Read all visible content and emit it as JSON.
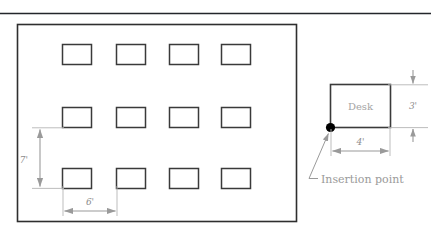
{
  "figure": {
    "title_rule": "top-horizontal-rule",
    "colors": {
      "outline": "#2e2e2e",
      "desk_stroke": "#3a3a3a",
      "dimension": "#9a9a9a",
      "text": "#8c8c8c",
      "label": "#9a9a9a",
      "insertion_dot": "#000000",
      "background": "#ffffff"
    }
  },
  "room_plan": {
    "name": "office-floor-plan",
    "rows": 3,
    "columns": 4,
    "desk_count": 12,
    "dimensions": [
      {
        "id": "vertical-row-spacing",
        "label": "7'",
        "value": 7,
        "unit": "ft",
        "orientation": "vertical",
        "describes": "row-to-row spacing"
      },
      {
        "id": "horizontal-column-spacing",
        "label": "6'",
        "value": 6,
        "unit": "ft",
        "orientation": "horizontal",
        "describes": "column-to-column spacing"
      }
    ]
  },
  "desk_detail": {
    "name": "desk-block-detail",
    "block_label": "Desk",
    "insertion_point_label": "Insertion point",
    "dimensions": [
      {
        "id": "desk-height",
        "label": "3'",
        "value": 3,
        "unit": "ft",
        "orientation": "vertical",
        "describes": "desk depth"
      },
      {
        "id": "desk-width",
        "label": "4'",
        "value": 4,
        "unit": "ft",
        "orientation": "horizontal",
        "describes": "desk width"
      }
    ]
  }
}
